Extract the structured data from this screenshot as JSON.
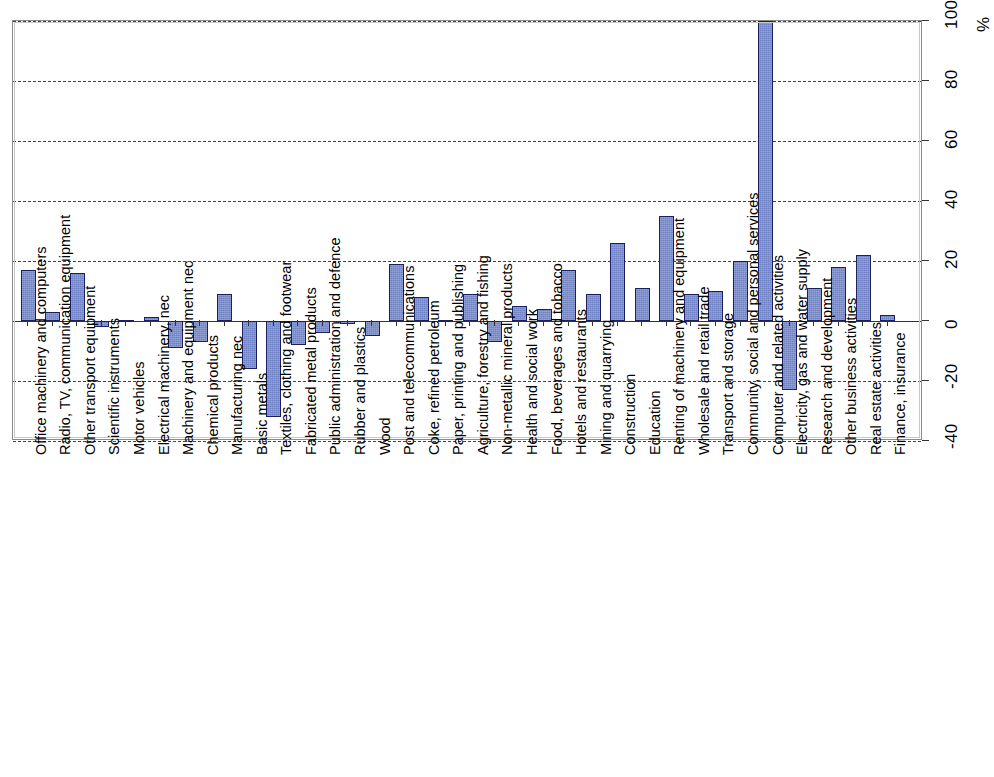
{
  "chart_data": {
    "type": "bar",
    "title": "",
    "subtitle": "",
    "xlabel": "",
    "ylabel": "%",
    "ylim": [
      -40,
      100
    ],
    "yticks": [
      -40,
      -20,
      0,
      20,
      40,
      60,
      80,
      100
    ],
    "ytick_labels": [
      "-40",
      "-20",
      "0",
      "20",
      "40",
      "60",
      "80",
      "100"
    ],
    "grid": true,
    "grid_style": "dashed horizontal",
    "legend": null,
    "legend_position": "none",
    "series_color": "#6e81c4",
    "series_edge_color": "#1b1f5e",
    "categories": [
      "Office machinery and computers",
      "Radio, TV, communication equipment",
      "Other transport equipment",
      "Scientific instruments",
      "Motor vehicles",
      "Electrical machinery, nec",
      "Machinery and equipment nec",
      "Chemical products",
      "Manufacturing nec",
      "Basic metals",
      "Textiles, clothing and footwear",
      "Fabricated metal products",
      "Public administration and defence",
      "Rubber and plastics",
      "Wood",
      "Post and telecommunications",
      "Coke, refined petroleum",
      "Paper, printing and publishing",
      "Agriculture, forestry and fishing",
      "Non-metallic mineral products",
      "Health and social work",
      "Food, beverages and tobacco",
      "Hotels and restaurants",
      "Mining and quarrying",
      "Construction",
      "Education",
      "Renting of machinery and equipment",
      "Wholesale and retail trade",
      "Transport and storage",
      "Community, social and personal services",
      "Computer and related activities",
      "Electricity, gas and water supply",
      "Research and development",
      "Other business activities",
      "Real estate activities",
      "Finance, insurance"
    ],
    "values": [
      17,
      3,
      16,
      -2,
      0.5,
      1.5,
      -9,
      -7,
      9,
      -16,
      -32,
      -8,
      -4,
      -1,
      -5,
      19,
      8,
      0.5,
      9,
      -7,
      5,
      4,
      17,
      9,
      26,
      11,
      35,
      9,
      10,
      20,
      100,
      -23,
      11,
      18,
      22,
      2
    ]
  }
}
